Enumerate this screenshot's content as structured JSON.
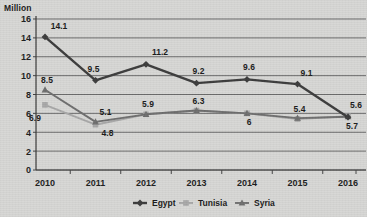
{
  "chart_data": {
    "type": "line",
    "title": "",
    "ylabel": "Million",
    "xlabel": "",
    "grid": true,
    "legend_position": "bottom-center",
    "ylim": [
      0,
      16
    ],
    "yticks": [
      "0",
      "2",
      "4",
      "6",
      "8",
      "10",
      "12",
      "14",
      "16"
    ],
    "categories": [
      "2010",
      "2011",
      "2012",
      "2013",
      "2014",
      "2015",
      "2016"
    ],
    "series": [
      {
        "name": "Egypt",
        "color": "#3c3c3c",
        "marker": "diamond",
        "values": [
          14.1,
          9.5,
          11.2,
          9.2,
          9.6,
          9.1,
          5.6
        ],
        "labels": [
          "14.1",
          "9.5",
          "11.2",
          "9.2",
          "9.6",
          "9.1",
          "5.6"
        ]
      },
      {
        "name": "Tunisia",
        "color": "#a8a8a8",
        "marker": "square",
        "values": [
          6.9,
          4.8,
          5.9,
          6.3,
          6.0,
          5.4,
          5.7
        ],
        "labels": [
          "6.9",
          "4.8",
          "5.9",
          "6.3",
          "6",
          "5.4",
          "5.7"
        ]
      },
      {
        "name": "Syria",
        "color": "#6e6e6e",
        "marker": "triangle",
        "values": [
          8.5,
          5.1,
          5.9,
          6.3,
          6.0,
          5.5,
          5.65
        ],
        "labels": [
          "8.5",
          "5.1",
          "",
          "",
          "",
          "",
          ""
        ]
      }
    ]
  },
  "legend": {
    "items": [
      {
        "label": "Egypt"
      },
      {
        "label": "Tunisia"
      },
      {
        "label": "Syria"
      }
    ]
  }
}
